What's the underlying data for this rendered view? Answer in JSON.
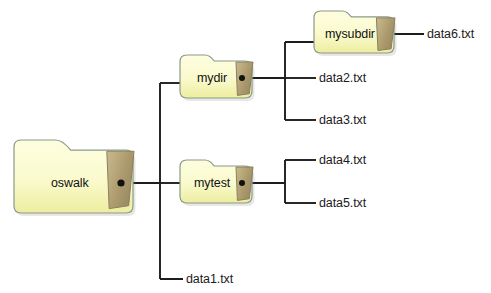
{
  "diagram": {
    "type": "directory-tree",
    "colors": {
      "folder_fill_light": "#fdfdd2",
      "folder_fill_dark": "#ece98f",
      "folder_stroke": "#8a9a8a",
      "folder_flap": "#b3a074",
      "folder_flap_stroke": "#8a8063",
      "line": "#1d1d1d",
      "text": "#151515",
      "background": "#ffffff"
    },
    "folders": [
      {
        "id": "oswalk",
        "label": "oswalk",
        "x": 14,
        "y": 140,
        "w": 119,
        "h": 73,
        "label_x": 70,
        "label_y": 183
      },
      {
        "id": "mydir",
        "label": "mydir",
        "x": 180,
        "y": 55,
        "w": 72,
        "h": 43,
        "label_x": 212,
        "label_y": 78
      },
      {
        "id": "mysubdir",
        "label": "mysubdir",
        "x": 314,
        "y": 11,
        "w": 80,
        "h": 42,
        "label_x": 350,
        "label_y": 34
      },
      {
        "id": "mytest",
        "label": "mytest",
        "x": 180,
        "y": 160,
        "w": 72,
        "h": 43,
        "label_x": 212,
        "label_y": 183
      }
    ],
    "files": [
      {
        "id": "data6",
        "label": "data6.txt",
        "x": 427,
        "y": 34,
        "stub_from": 394,
        "stub_to": 424
      },
      {
        "id": "data2",
        "label": "data2.txt",
        "x": 319,
        "y": 78,
        "stub_from": 285,
        "stub_to": 316
      },
      {
        "id": "data3",
        "label": "data3.txt",
        "x": 319,
        "y": 120,
        "stub_from": 285,
        "stub_to": 316
      },
      {
        "id": "data4",
        "label": "data4.txt",
        "x": 319,
        "y": 160,
        "stub_from": 285,
        "stub_to": 316
      },
      {
        "id": "data5",
        "label": "data5.txt",
        "x": 319,
        "y": 203,
        "stub_from": 285,
        "stub_to": 316
      },
      {
        "id": "data1",
        "label": "data1.txt",
        "x": 186,
        "y": 279,
        "stub_from": 160,
        "stub_to": 183
      }
    ],
    "connectors": {
      "oswalk_out": {
        "x1": 121,
        "y1": 183,
        "x2": 160,
        "y2": 183
      },
      "trunk_main": {
        "x": 160,
        "y1": 83,
        "y2": 279
      },
      "branch_mydir": {
        "x1": 160,
        "y1": 83,
        "x2": 183,
        "y2": 83
      },
      "branch_mytest": {
        "x1": 160,
        "y1": 183,
        "x2": 183,
        "y2": 183
      },
      "branch_data1": {
        "x1": 160,
        "y1": 279,
        "x2": 183,
        "y2": 279
      },
      "mydir_out": {
        "x1": 240,
        "y1": 78,
        "x2": 285,
        "y2": 78
      },
      "trunk_mydir_children": {
        "x": 285,
        "y1": 42,
        "y2": 120
      },
      "branch_mysubdir": {
        "x1": 285,
        "y1": 42,
        "x2": 318,
        "y2": 42
      },
      "mysubdir_out": {
        "x1": 382,
        "y1": 34,
        "x2": 424,
        "y2": 34
      },
      "mytest_out": {
        "x1": 240,
        "y1": 183,
        "x2": 285,
        "y2": 183
      },
      "trunk_mytest_children": {
        "x": 285,
        "y1": 160,
        "y2": 203
      }
    },
    "dots": [
      {
        "id": "oswalk-connector-dot",
        "cx": 121,
        "cy": 183,
        "r": 3.6
      },
      {
        "id": "mydir-connector-dot",
        "cx": 242,
        "cy": 78,
        "r": 3.0
      },
      {
        "id": "mytest-connector-dot",
        "cx": 242,
        "cy": 183,
        "r": 3.0
      }
    ]
  }
}
